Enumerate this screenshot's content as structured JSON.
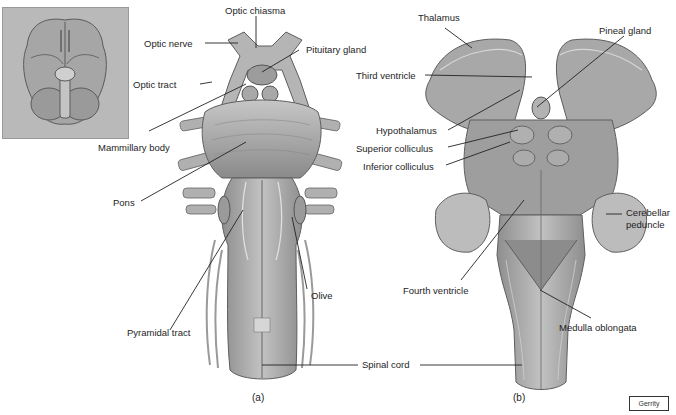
{
  "figure": {
    "colors": {
      "background": "#ffffff",
      "tissue_light": "#bdbdbd",
      "tissue_mid": "#a4a4a4",
      "tissue_dark": "#7c7c7c",
      "outline": "#555555",
      "leader_line": "#222222",
      "inset_background": "#b9b9b9"
    },
    "inset": {
      "description": "Inferior view of whole brain (thumbnail)"
    },
    "panel_a": {
      "caption": "(a)",
      "labels": {
        "optic_chiasma": "Optic chiasma",
        "optic_nerve": "Optic nerve",
        "pituitary_gland": "Pituitary gland",
        "optic_tract": "Optic tract",
        "mammillary_body": "Mammillary body",
        "pons": "Pons",
        "olive": "Olive",
        "pyramidal_tract": "Pyramidal tract"
      }
    },
    "shared": {
      "spinal_cord": "Spinal cord"
    },
    "panel_b": {
      "caption": "(b)",
      "labels": {
        "thalamus": "Thalamus",
        "pineal_gland": "Pineal gland",
        "third_ventricle": "Third ventricle",
        "hypothalamus": "Hypothalamus",
        "superior_colliculus": "Superior colliculus",
        "inferior_colliculus": "Inferior colliculus",
        "cerebellar_peduncle_line1": "Cerebellar",
        "cerebellar_peduncle_line2": "peduncle",
        "fourth_ventricle": "Fourth ventricle",
        "medulla_oblongata": "Medulla oblongata"
      }
    },
    "credit": "Gerrity"
  }
}
